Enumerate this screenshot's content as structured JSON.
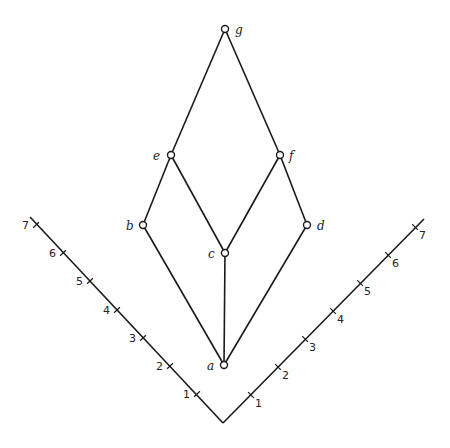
{
  "diagram": {
    "type": "hasse-diagram",
    "nodes": [
      {
        "id": "g",
        "label": "g",
        "x": 225,
        "y": 29,
        "lx": 235,
        "ly": 34
      },
      {
        "id": "e",
        "label": "e",
        "x": 171,
        "y": 155,
        "lx": 153,
        "ly": 160
      },
      {
        "id": "f",
        "label": "f",
        "x": 280,
        "y": 155,
        "lx": 289,
        "ly": 160
      },
      {
        "id": "b",
        "label": "b",
        "x": 143,
        "y": 225,
        "lx": 126,
        "ly": 230
      },
      {
        "id": "d",
        "label": "d",
        "x": 307,
        "y": 225,
        "lx": 317,
        "ly": 230
      },
      {
        "id": "c",
        "label": "c",
        "x": 225,
        "y": 253,
        "lx": 208,
        "ly": 258
      },
      {
        "id": "a",
        "label": "a",
        "x": 224,
        "y": 365,
        "lx": 207,
        "ly": 370
      }
    ],
    "edges": [
      [
        "g",
        "e"
      ],
      [
        "g",
        "f"
      ],
      [
        "e",
        "b"
      ],
      [
        "e",
        "c"
      ],
      [
        "f",
        "c"
      ],
      [
        "f",
        "d"
      ],
      [
        "b",
        "a"
      ],
      [
        "c",
        "a"
      ],
      [
        "d",
        "a"
      ]
    ],
    "scale_axes": {
      "vertex": {
        "x": 223,
        "y": 423
      },
      "left": {
        "end": {
          "x": 30,
          "y": 217
        },
        "ticks": [
          {
            "label": "1",
            "x": 197,
            "y": 394
          },
          {
            "label": "2",
            "x": 170,
            "y": 366
          },
          {
            "label": "3",
            "x": 143,
            "y": 338
          },
          {
            "label": "4",
            "x": 117,
            "y": 310
          },
          {
            "label": "5",
            "x": 90,
            "y": 281
          },
          {
            "label": "6",
            "x": 63,
            "y": 253
          },
          {
            "label": "7",
            "x": 36,
            "y": 225
          }
        ]
      },
      "right": {
        "end": {
          "x": 424,
          "y": 219
        },
        "ticks": [
          {
            "label": "1",
            "x": 251,
            "y": 395
          },
          {
            "label": "2",
            "x": 278,
            "y": 367
          },
          {
            "label": "3",
            "x": 305,
            "y": 339
          },
          {
            "label": "4",
            "x": 333,
            "y": 311
          },
          {
            "label": "5",
            "x": 360,
            "y": 283
          },
          {
            "label": "6",
            "x": 388,
            "y": 255
          },
          {
            "label": "7",
            "x": 415,
            "y": 227
          }
        ]
      }
    }
  }
}
